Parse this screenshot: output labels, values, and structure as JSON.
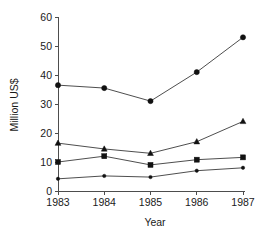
{
  "chart_data": {
    "type": "line",
    "title": "",
    "subtitle": "",
    "xlabel": "Year",
    "ylabel": "Million US$",
    "x": [
      1983,
      1984,
      1985,
      1986,
      1987
    ],
    "categories": [
      "1983",
      "1984",
      "1985",
      "1986",
      "1987"
    ],
    "xtick_labels": [
      "1983",
      "1984",
      "1985",
      "1986",
      "1987"
    ],
    "ytick_labels": [
      "0",
      "10",
      "20",
      "30",
      "40",
      "50",
      "60"
    ],
    "ytick_values": [
      0,
      10,
      20,
      30,
      40,
      50,
      60
    ],
    "xlim": [
      1983,
      1987
    ],
    "ylim": [
      0,
      60
    ],
    "grid": false,
    "legend": "none",
    "series": [
      {
        "name": "series-1",
        "marker": "circle",
        "values": [
          36.5,
          35.5,
          31.0,
          41.0,
          53.0
        ]
      },
      {
        "name": "series-2",
        "marker": "triangle",
        "values": [
          16.5,
          14.5,
          13.0,
          17.0,
          24.0
        ]
      },
      {
        "name": "series-3",
        "marker": "square",
        "values": [
          10.0,
          12.0,
          9.0,
          10.8,
          11.6
        ]
      },
      {
        "name": "series-4",
        "marker": "dot",
        "values": [
          4.2,
          5.2,
          4.8,
          7.0,
          8.0
        ]
      }
    ],
    "colors": {
      "line": "#3a3a3a",
      "marker": "#111111",
      "axis": "#4d4d4d",
      "text": "#1a1a1a",
      "background": "#ffffff"
    }
  },
  "axes": {
    "y_title": "Million US$",
    "x_title": "Year"
  }
}
